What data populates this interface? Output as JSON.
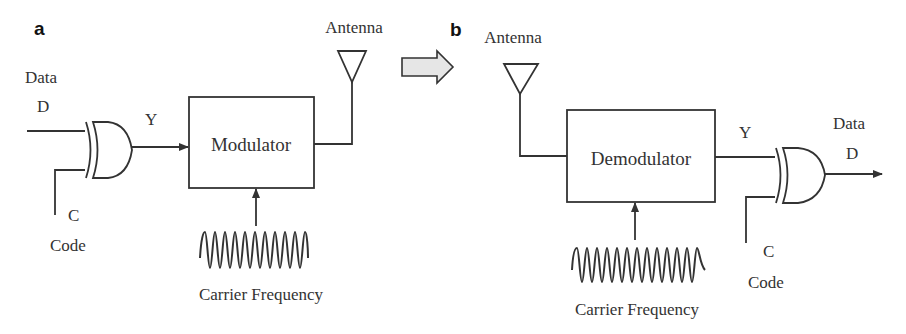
{
  "panels": {
    "a": {
      "label": "a",
      "data_label": "Data",
      "data_symbol": "D",
      "xor_output": "Y",
      "block": "Modulator",
      "antenna": "Antenna",
      "code_symbol": "C",
      "code_label": "Code",
      "carrier": "Carrier Frequency"
    },
    "b": {
      "label": "b",
      "antenna": "Antenna",
      "block": "Demodulator",
      "block_output": "Y",
      "data_label": "Data",
      "data_symbol": "D",
      "code_symbol": "C",
      "code_label": "Code",
      "carrier": "Carrier Frequency"
    }
  },
  "transition_arrow": "block-arrow-right",
  "colors": {
    "stroke": "#333333",
    "arrow_fill": "#e6e6e6",
    "background": "#ffffff"
  }
}
